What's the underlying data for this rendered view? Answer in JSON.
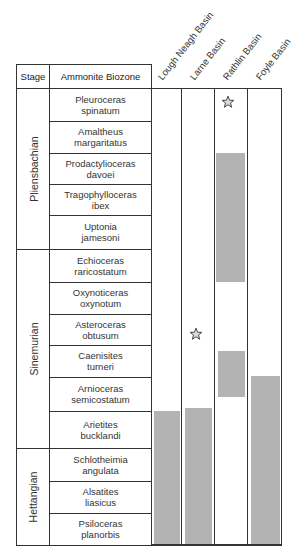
{
  "header": {
    "stage_label": "Stage",
    "biozone_label": "Ammonite Biozone"
  },
  "basins": [
    {
      "name": "Lough Neagh Basin"
    },
    {
      "name": "Larne Basin"
    },
    {
      "name": "Rathlin Basin"
    },
    {
      "name": "Foyle Basin"
    }
  ],
  "stages": [
    {
      "name": "Pliensbachian"
    },
    {
      "name": "Sinemurian"
    },
    {
      "name": "Hettangian"
    }
  ],
  "biozones": [
    {
      "genus": "Pleuroceras",
      "species": "spinatum",
      "stage": "Pliensbachian"
    },
    {
      "genus": "Amaltheus",
      "species": "margaritatus",
      "stage": "Pliensbachian"
    },
    {
      "genus": "Prodactylioceras",
      "species": "davoei",
      "stage": "Pliensbachian"
    },
    {
      "genus": "Tragophylloceras",
      "species": "ibex",
      "stage": "Pliensbachian"
    },
    {
      "genus": "Uptonia",
      "species": "jamesoni",
      "stage": "Pliensbachian"
    },
    {
      "genus": "Echioceras",
      "species": "raricostatum",
      "stage": "Sinemurian"
    },
    {
      "genus": "Oxynoticeras",
      "species": "oxynotum",
      "stage": "Sinemurian"
    },
    {
      "genus": "Asteroceras",
      "species": "obtusum",
      "stage": "Sinemurian"
    },
    {
      "genus": "Caenisites",
      "species": "turneri",
      "stage": "Sinemurian"
    },
    {
      "genus": "Arnioceras",
      "species": "semicostatum",
      "stage": "Sinemurian"
    },
    {
      "genus": "Arietites",
      "species": "bucklandi",
      "stage": "Sinemurian"
    },
    {
      "genus": "Schlotheimia",
      "species": "angulata",
      "stage": "Hettangian"
    },
    {
      "genus": "Alsatites",
      "species": "liasicus",
      "stage": "Hettangian"
    },
    {
      "genus": "Psiloceras",
      "species": "planorbis",
      "stage": "Hettangian"
    }
  ],
  "occurrence": {
    "Lough Neagh Basin": {
      "ranges": [
        "Arietites bucklandi (upper part) to Psiloceras planorbis"
      ],
      "stars": []
    },
    "Larne Basin": {
      "ranges": [
        "Arietites bucklandi (upper part) to Psiloceras planorbis"
      ],
      "stars": [
        "Asteroceras obtusum"
      ]
    },
    "Rathlin Basin": {
      "ranges": [
        "Prodactylioceras davoei to Echioceras raricostatum",
        "Caenisites turneri to Arnioceras semicostatum (upper part)"
      ],
      "stars": [
        "Pleuroceras spinatum"
      ]
    },
    "Foyle Basin": {
      "ranges": [
        "Arnioceras semicostatum (lower part) to Psiloceras planorbis"
      ],
      "stars": []
    }
  },
  "colors": {
    "range_fill": "#b3b3b3",
    "line": "#333333",
    "star_fill": "#d9d9d9"
  }
}
